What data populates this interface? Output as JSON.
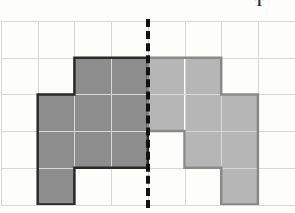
{
  "figure": {
    "title_mark": "T",
    "background_color": "#fdfdfc"
  },
  "grid": {
    "columns": 8,
    "rows": 5,
    "cell_size": 36.7,
    "origin_x": 1,
    "origin_y": 21,
    "line_color": "#d8d8d8",
    "grid_visible": true
  },
  "symmetry_line": {
    "type": "dashed-vertical",
    "at_column_boundary": 4,
    "x": 148,
    "color": "#111111",
    "dash_width": 4
  },
  "shapes": [
    {
      "name": "left-shape",
      "side": "left",
      "fill": "#8d8d8d",
      "stroke": "#2a2a2a",
      "stroke_width": 2.5,
      "cells": [
        {
          "col": 2,
          "row": 1
        },
        {
          "col": 3,
          "row": 1
        },
        {
          "col": 1,
          "row": 2
        },
        {
          "col": 2,
          "row": 2
        },
        {
          "col": 3,
          "row": 2
        },
        {
          "col": 1,
          "row": 3
        },
        {
          "col": 2,
          "row": 3
        },
        {
          "col": 3,
          "row": 3
        },
        {
          "col": 1,
          "row": 4
        }
      ],
      "cell_count": 9
    },
    {
      "name": "right-shape",
      "side": "right",
      "fill": "#b6b6b6",
      "stroke": "#8a8a8a",
      "stroke_width": 2.5,
      "cells": [
        {
          "col": 4,
          "row": 1
        },
        {
          "col": 5,
          "row": 1
        },
        {
          "col": 4,
          "row": 2
        },
        {
          "col": 5,
          "row": 2
        },
        {
          "col": 6,
          "row": 2
        },
        {
          "col": 5,
          "row": 3
        },
        {
          "col": 6,
          "row": 3
        },
        {
          "col": 6,
          "row": 4
        }
      ],
      "cell_count": 8
    }
  ],
  "chart_data": {
    "type": "heatmap",
    "title": "",
    "xlabel": "",
    "ylabel": "",
    "grid": true,
    "columns": 8,
    "rows": 5,
    "legend": [
      {
        "label": "left shape",
        "color": "#8d8d8d"
      },
      {
        "label": "right shape",
        "color": "#b6b6b6"
      },
      {
        "label": "empty",
        "color": "#ffffff"
      }
    ],
    "matrix": [
      [
        "empty",
        "empty",
        "empty",
        "empty",
        "empty",
        "empty",
        "empty",
        "empty"
      ],
      [
        "empty",
        "empty",
        "left",
        "left",
        "right",
        "right",
        "empty",
        "empty"
      ],
      [
        "empty",
        "left",
        "left",
        "left",
        "right",
        "right",
        "right",
        "empty"
      ],
      [
        "empty",
        "left",
        "left",
        "left",
        "empty",
        "right",
        "right",
        "empty"
      ],
      [
        "empty",
        "left",
        "empty",
        "empty",
        "empty",
        "empty",
        "right",
        "empty"
      ]
    ],
    "annotations": [
      {
        "type": "vline",
        "x": 4,
        "style": "dashed",
        "color": "#111111"
      }
    ]
  }
}
